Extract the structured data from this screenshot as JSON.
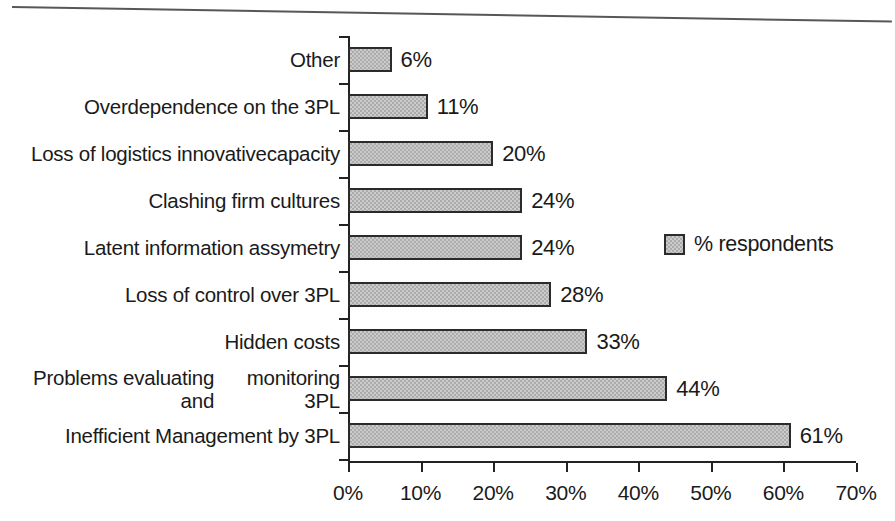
{
  "chart_data": {
    "type": "bar",
    "orientation": "horizontal",
    "title": "",
    "subtitle": "",
    "xlabel": "",
    "ylabel": "",
    "xlim": [
      0,
      70
    ],
    "xticks": [
      0,
      10,
      20,
      30,
      40,
      50,
      60,
      70
    ],
    "xtick_labels": [
      "0%",
      "10%",
      "20%",
      "30%",
      "40%",
      "50%",
      "60%",
      "70%"
    ],
    "grid": false,
    "legend_position": "middle-right",
    "legend": [
      "% respondents"
    ],
    "series": [
      {
        "name": "% respondents",
        "values": [
          6,
          11,
          20,
          24,
          24,
          28,
          33,
          44,
          61
        ]
      }
    ],
    "categories": [
      "Other",
      "Overdependence on the 3PL",
      "Loss of logistics innovative capacity",
      "Clashing firm cultures",
      "Latent information assymetry",
      "Loss of control over 3PL",
      "Hidden costs",
      "Problems evaluating and monitoring 3PL",
      "Inefficient Management by 3PL"
    ],
    "category_label_lines": [
      [
        "Other"
      ],
      [
        "Overdependence on the 3PL"
      ],
      [
        "Loss of logistics innovative",
        "capacity"
      ],
      [
        "Clashing firm cultures"
      ],
      [
        "Latent information assymetry"
      ],
      [
        "Loss of control over 3PL"
      ],
      [
        "Hidden costs"
      ],
      [
        "Problems evaluating and",
        "monitoring 3PL"
      ],
      [
        "Inefficient Management by 3PL"
      ]
    ],
    "data_labels": [
      "6%",
      "11%",
      "20%",
      "24%",
      "24%",
      "28%",
      "33%",
      "44%",
      "61%"
    ],
    "colors": {
      "bar_fill": "#ababab",
      "bar_border": "#2b2b2b",
      "axis": "#222222",
      "text": "#1a1a1a",
      "background": "#ffffff"
    }
  }
}
